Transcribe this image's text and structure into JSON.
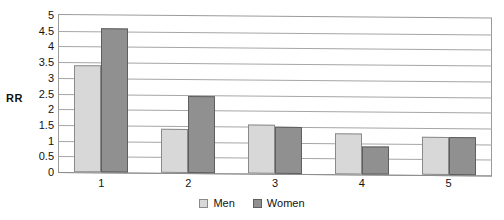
{
  "page_header_remnant": "",
  "chart_data": {
    "type": "bar",
    "title": "",
    "xlabel": "",
    "ylabel": "RR",
    "categories": [
      "1",
      "2",
      "3",
      "4",
      "5"
    ],
    "series": [
      {
        "name": "Men",
        "color": "#d8d8d8",
        "values": [
          3.4,
          1.4,
          1.55,
          1.3,
          1.2
        ]
      },
      {
        "name": "Women",
        "color": "#909090",
        "values": [
          4.6,
          2.45,
          1.5,
          0.9,
          1.2
        ]
      }
    ],
    "ylim": [
      0,
      5
    ],
    "ytick_step": 0.5,
    "yticks": [
      "5",
      "4.5",
      "4",
      "3.5",
      "3",
      "2.5",
      "2",
      "1.5",
      "1",
      "0.5",
      "0"
    ],
    "grid": true,
    "legend_position": "bottom"
  },
  "legend": {
    "items": [
      {
        "label": "Men",
        "swatch": "men"
      },
      {
        "label": "Women",
        "swatch": "women"
      }
    ]
  }
}
